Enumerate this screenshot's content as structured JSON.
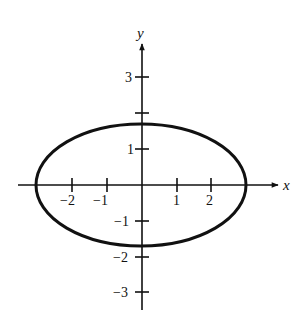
{
  "diagram": {
    "type": "ellipse-graph",
    "equation_hint": "x^2/9 + y^2/3 = 1",
    "axes": {
      "x_label": "x",
      "y_label": "y",
      "x_ticks": [
        {
          "value": -2,
          "label": "−2"
        },
        {
          "value": -1,
          "label": "−1"
        },
        {
          "value": 1,
          "label": "1"
        },
        {
          "value": 2,
          "label": "2"
        }
      ],
      "y_ticks": [
        {
          "value": 3,
          "label": "3"
        },
        {
          "value": 2,
          "label": ""
        },
        {
          "value": 1,
          "label": "1"
        },
        {
          "value": -1,
          "label": "−1"
        },
        {
          "value": -2,
          "label": "−2"
        },
        {
          "value": -3,
          "label": "−3"
        }
      ]
    },
    "ellipse": {
      "center": [
        0,
        0
      ],
      "semi_major_x": 3,
      "semi_minor_y": 1.73,
      "stroke_color": "#111111"
    }
  }
}
